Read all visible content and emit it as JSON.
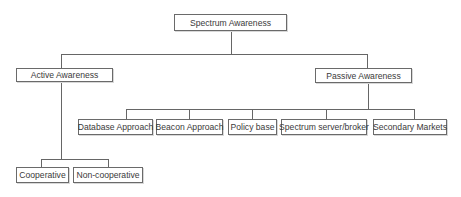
{
  "diagram": {
    "type": "hierarchy",
    "root": {
      "label": "Spectrum Awareness",
      "children": [
        {
          "label": "Active Awareness",
          "children": [
            {
              "label": "Cooperative"
            },
            {
              "label": "Non-cooperative"
            }
          ]
        },
        {
          "label": "Passive Awareness",
          "children": [
            {
              "label": "Database Approach"
            },
            {
              "label": "Beacon Approach"
            },
            {
              "label": "Policy base"
            },
            {
              "label": "Spectrum server/broker"
            },
            {
              "label": "Secondary Markets"
            }
          ]
        }
      ]
    }
  },
  "nodes": {
    "root": "Spectrum Awareness",
    "active": "Active Awareness",
    "passive": "Passive Awareness",
    "cooperative": "Cooperative",
    "non_cooperative": "Non-cooperative",
    "database": "Database Approach",
    "beacon": "Beacon Approach",
    "policy": "Policy base",
    "broker": "Spectrum server/broker",
    "secondary": "Secondary Markets"
  }
}
